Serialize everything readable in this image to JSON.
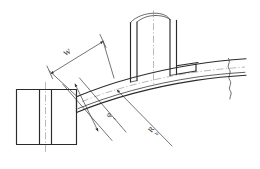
{
  "figure": {
    "type": "engineering-line-drawing",
    "background_color": "#ffffff",
    "line_color": "#2b2b2b",
    "centerline_color": "#8a8a8a"
  },
  "dimensions": {
    "width_label": "W",
    "thickness_symbol": "φ",
    "thickness_subscript": "t",
    "radius_symbol": "R",
    "radius_subscript": "b"
  },
  "annotations": [
    {
      "name": "width-dimension",
      "label": "W",
      "style": "double-arrow",
      "orientation": "inclined"
    },
    {
      "name": "thickness-dimension",
      "label": "φ",
      "subscript": "t",
      "style": "double-arrow",
      "orientation": "inclined"
    },
    {
      "name": "radius-dimension",
      "label": "R",
      "subscript": "b",
      "style": "leader",
      "orientation": "inclined"
    }
  ],
  "parts": [
    {
      "name": "left-end-block",
      "description": "rectangular end block with internal vertical divisions"
    },
    {
      "name": "curved-strip",
      "description": "curved band extending right from end block"
    },
    {
      "name": "vertical-flange",
      "description": "upright flange assembly at right with break line"
    },
    {
      "name": "right-break",
      "description": "wavy break line terminating the strip at right"
    }
  ],
  "caption": ""
}
